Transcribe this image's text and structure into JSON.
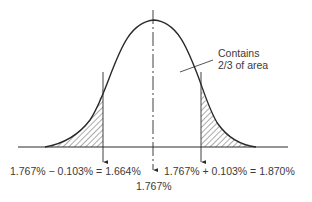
{
  "diagram": {
    "type": "normal-distribution",
    "annotation": {
      "line1": "Contains",
      "line2": "2/3 of area"
    },
    "labels": {
      "lower": "1.767% − 0.103% = 1.664%",
      "upper": "1.767% + 0.103% = 1.870%",
      "mean": "1.767%"
    },
    "values": {
      "mean": 1.767,
      "std_dev": 0.103,
      "lower_bound": 1.664,
      "upper_bound": 1.87
    },
    "colors": {
      "stroke": "#2a2a2a",
      "text": "#3a3a3a",
      "hatch": "#444444"
    }
  }
}
